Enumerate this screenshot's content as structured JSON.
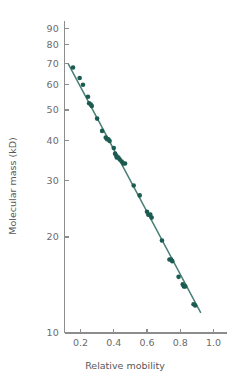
{
  "chart_data": {
    "type": "scatter",
    "title": "",
    "xlabel": "Relative mobility",
    "ylabel": "Molecular mass (kD)",
    "xscale": "linear",
    "yscale": "log",
    "xlim": [
      0.08,
      1.08
    ],
    "ylim": [
      10,
      95
    ],
    "grid": false,
    "legend": null,
    "xticks": [
      0.2,
      0.4,
      0.6,
      0.8,
      1.0
    ],
    "xtick_labels": [
      "0.2",
      "0.4",
      "0.6",
      "0.8",
      "1.0"
    ],
    "yticks": [
      10,
      20,
      30,
      40,
      50,
      60,
      70,
      80,
      90
    ],
    "ytick_labels": [
      "10",
      "20",
      "30",
      "40",
      "50",
      "60",
      "70",
      "80",
      "90"
    ],
    "point_color": "#1c5b51",
    "line_color": "#4a8076",
    "axis_color": "#8d8d8f",
    "text_color": "#58585a",
    "marker_size": 2.3,
    "series": [
      {
        "name": "protein standards",
        "points": [
          [
            0.155,
            68.0
          ],
          [
            0.195,
            63.0
          ],
          [
            0.215,
            60.0
          ],
          [
            0.245,
            55.0
          ],
          [
            0.252,
            52.5
          ],
          [
            0.262,
            52.0
          ],
          [
            0.268,
            51.5
          ],
          [
            0.3,
            47.0
          ],
          [
            0.33,
            43.0
          ],
          [
            0.352,
            41.0
          ],
          [
            0.36,
            40.5
          ],
          [
            0.368,
            40.5
          ],
          [
            0.375,
            40.0
          ],
          [
            0.4,
            38.0
          ],
          [
            0.408,
            36.5
          ],
          [
            0.415,
            36.0
          ],
          [
            0.418,
            35.5
          ],
          [
            0.428,
            35.5
          ],
          [
            0.436,
            35.0
          ],
          [
            0.448,
            34.5
          ],
          [
            0.458,
            34.0
          ],
          [
            0.468,
            34.0
          ],
          [
            0.52,
            29.0
          ],
          [
            0.556,
            27.0
          ],
          [
            0.6,
            24.0
          ],
          [
            0.608,
            23.5
          ],
          [
            0.62,
            23.5
          ],
          [
            0.628,
            23.0
          ],
          [
            0.69,
            19.5
          ],
          [
            0.735,
            17.0
          ],
          [
            0.745,
            17.0
          ],
          [
            0.752,
            16.8
          ],
          [
            0.79,
            15.0
          ],
          [
            0.815,
            14.2
          ],
          [
            0.822,
            14.0
          ],
          [
            0.83,
            14.0
          ],
          [
            0.88,
            12.3
          ],
          [
            0.89,
            12.2
          ]
        ]
      }
    ],
    "fit_line": {
      "name": "regression line",
      "x_start": 0.128,
      "y_start": 69.5,
      "x_end": 0.922,
      "y_end": 11.6
    }
  }
}
